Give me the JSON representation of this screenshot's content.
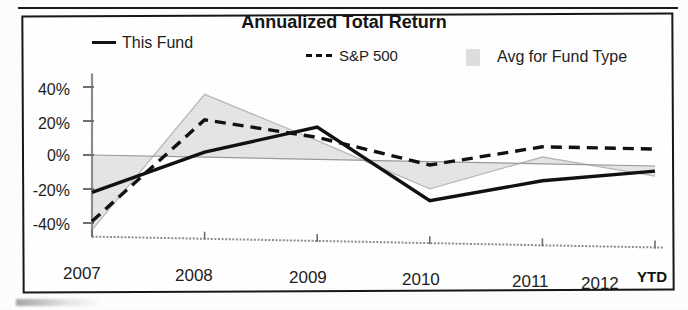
{
  "chart_data": {
    "type": "line",
    "title": "Annualized Total Return",
    "xlabel": "",
    "ylabel": "",
    "x": [
      "2007",
      "2008",
      "2009",
      "2010",
      "2011",
      "2012"
    ],
    "x_axis_note": "YTD",
    "categories": [
      "2007",
      "2008",
      "2009",
      "2010",
      "2011",
      "2012"
    ],
    "ylim": [
      -48,
      48
    ],
    "yticks": [
      40,
      20,
      0,
      -20,
      -40
    ],
    "ytick_labels": [
      "40%",
      "20%",
      "0%",
      "-20%",
      "-40%"
    ],
    "grid": false,
    "legend_position": "top",
    "zero_line": true,
    "series": [
      {
        "name": "This Fund",
        "style": "solid",
        "color": "#111111",
        "values": [
          -22,
          3,
          19,
          -23,
          -10,
          -3
        ]
      },
      {
        "name": "S&P 500",
        "style": "dashed",
        "color": "#111111",
        "values": [
          -39,
          22,
          13,
          -2,
          10,
          10
        ]
      },
      {
        "name": "Avg for Fund Type",
        "style": "area",
        "color": "#dedede",
        "values": [
          -44,
          37,
          11,
          -16,
          4,
          -6
        ]
      }
    ]
  },
  "chart": {
    "title": "Annualized Total Return",
    "ytd_label": "YTD"
  },
  "legend": {
    "items": [
      {
        "label": "This Fund",
        "marker": "solid-line-swatch"
      },
      {
        "label": "S&P 500",
        "marker": "dashed-line-swatch"
      },
      {
        "label": "Avg for Fund Type",
        "marker": "gray-area-swatch"
      }
    ]
  },
  "axes": {
    "y_labels": [
      "40%",
      "20%",
      "0%",
      "-20%",
      "-40%"
    ],
    "x_labels": [
      "2007",
      "2008",
      "2009",
      "2010",
      "2011",
      "2012"
    ]
  }
}
